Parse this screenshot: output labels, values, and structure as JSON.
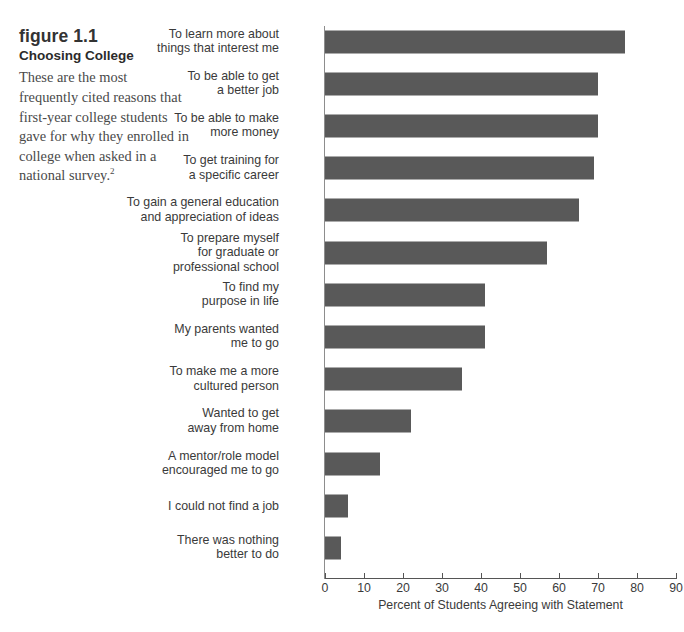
{
  "caption": {
    "figure_number": "figure 1.1",
    "title": "Choosing College",
    "description": "These are the most frequently cited reasons that first-year college students gave for why they enrolled in college when asked in a national survey.",
    "footnote_marker": "2"
  },
  "colors": {
    "bar": "#595959",
    "axis": "#555555",
    "text": "#3a3a3a",
    "background": "#ffffff"
  },
  "chart_data": {
    "type": "bar",
    "orientation": "horizontal",
    "title": "Choosing College",
    "xlabel": "Percent of Students Agreeing with Statement",
    "ylabel": "",
    "xlim": [
      0,
      90
    ],
    "xticks": [
      0,
      10,
      20,
      30,
      40,
      50,
      60,
      70,
      80,
      90
    ],
    "xtick_labels": [
      "0",
      "10",
      "20",
      "30",
      "40",
      "50",
      "60",
      "70",
      "80",
      "90"
    ],
    "grid": false,
    "legend": false,
    "categories": [
      "To learn more about\nthings that interest me",
      "To be able to get\na better job",
      "To be able to make\nmore money",
      "To get training for\na specific career",
      "To gain a general education\nand appreciation of ideas",
      "To prepare myself\nfor graduate or\nprofessional school",
      "To find my\npurpose in life",
      "My parents wanted\nme to go",
      "To make me a more\ncultured person",
      "Wanted to get\naway from home",
      "A mentor/role model\nencouraged me to go",
      "I could not find a job",
      "There was nothing\nbetter to do"
    ],
    "values": [
      77,
      70,
      70,
      69,
      65,
      57,
      41,
      41,
      35,
      22,
      14,
      6,
      4
    ]
  }
}
